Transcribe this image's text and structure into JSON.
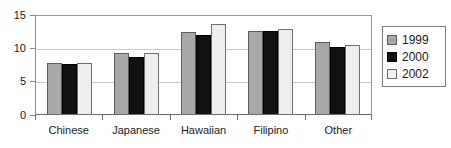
{
  "chart_data": {
    "type": "bar",
    "title": "",
    "subtitle": "",
    "xlabel": "",
    "ylabel": "",
    "categories": [
      "Chinese",
      "Japanese",
      "Hawaiian",
      "Filipino",
      "Other"
    ],
    "series": [
      {
        "name": "1999",
        "color": "#a8a8a8",
        "values": [
          7.6,
          9.2,
          12.3,
          12.5,
          10.8
        ]
      },
      {
        "name": "2000",
        "color": "#111111",
        "values": [
          7.5,
          8.5,
          11.8,
          12.4,
          10.1
        ]
      },
      {
        "name": "2002",
        "color": "#eeeeee",
        "values": [
          7.7,
          9.2,
          13.5,
          12.8,
          10.4
        ]
      }
    ],
    "ylim": [
      0,
      15
    ],
    "yticks": [
      0,
      5,
      10,
      15
    ],
    "ytick_labels": [
      "0",
      "5",
      "10",
      "15"
    ],
    "grid": true,
    "grid_axis": "y",
    "legend_position": "right",
    "legend_entries": [
      "1999",
      "2000",
      "2002"
    ]
  },
  "axes": {
    "y_tick_labels": [
      "15",
      "10",
      "5",
      "0"
    ]
  },
  "legend": {
    "items": [
      {
        "label": "1999"
      },
      {
        "label": "2000"
      },
      {
        "label": "2002"
      }
    ]
  }
}
